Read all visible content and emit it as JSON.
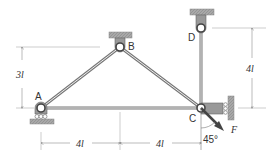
{
  "diagram": {
    "type": "truss",
    "nodes": [
      {
        "id": "A",
        "label": "A",
        "support": "roller (floor)"
      },
      {
        "id": "B",
        "label": "B",
        "support": "pin (ceiling)"
      },
      {
        "id": "C",
        "label": "C",
        "support": "roller (wall, right)"
      },
      {
        "id": "D",
        "label": "D",
        "support": "pin (ceiling)"
      }
    ],
    "members": [
      "AB",
      "BC",
      "AC",
      "CD"
    ],
    "dimensions": {
      "left_height": "3l",
      "right_height": "4l",
      "bottom_left": "4l",
      "bottom_right": "4l"
    },
    "force": {
      "label": "F",
      "angle": "45°",
      "at": "C"
    },
    "colors": {
      "member": "#8a8a8a",
      "support": "#9a9a9a",
      "line": "#555555"
    }
  }
}
